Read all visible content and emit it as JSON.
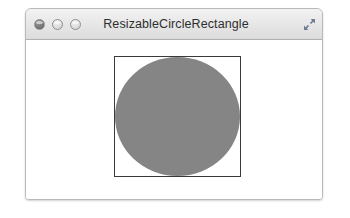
{
  "window": {
    "title": "ResizableCircleRectangle",
    "controls": {
      "close_label": "Close",
      "minimize_label": "Minimize",
      "maximize_label": "Zoom",
      "expand_label": "Enter Full Screen"
    },
    "titlebar_color": "#e6e6e6",
    "border_color": "#b9b9b9"
  },
  "canvas": {
    "background_color": "#ffffff",
    "rectangle": {
      "stroke_color": "#3a3a3a",
      "fill_color": "none",
      "width": 127,
      "height": 121
    },
    "circle": {
      "fill_color": "#858585",
      "stroke_color": "none",
      "diameter": 121
    }
  }
}
